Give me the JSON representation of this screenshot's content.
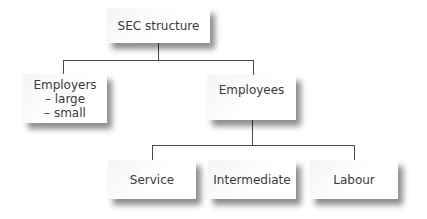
{
  "diagram": {
    "type": "tree",
    "root": {
      "label": "SEC structure"
    },
    "level1": [
      {
        "label": "Employers",
        "sub_items": [
          "– large",
          "– small"
        ]
      },
      {
        "label": "Employees"
      }
    ],
    "level2": [
      {
        "parent": "Employees",
        "label": "Service"
      },
      {
        "parent": "Employees",
        "label": "Intermediate"
      },
      {
        "parent": "Employees",
        "label": "Labour"
      }
    ]
  }
}
